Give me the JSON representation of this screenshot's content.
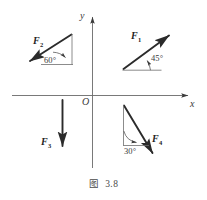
{
  "figure": {
    "caption_prefix": "图",
    "caption_number": "3.8",
    "background_color": "#ffffff",
    "ink_color": "#2e2e2e"
  },
  "axes": {
    "x_label": "x",
    "y_label": "y",
    "origin_label": "O",
    "x_axis_name": "horizontal-axis",
    "y_axis_name": "vertical-axis"
  },
  "forces": [
    {
      "id": "F1",
      "label_main": "F",
      "label_sub": "1",
      "angle_text": "45°",
      "quadrant": "first",
      "direction": "up-right",
      "description": "force vector pointing up and to the right at 45 degrees above the positive x direction"
    },
    {
      "id": "F2",
      "label_main": "F",
      "label_sub": "2",
      "angle_text": "60°",
      "quadrant": "second",
      "direction": "down-left",
      "description": "force vector pointing down and to the left, 60 degrees from horizontal reference"
    },
    {
      "id": "F3",
      "label_main": "F",
      "label_sub": "3",
      "angle_text": "",
      "quadrant": "third",
      "direction": "down",
      "description": "force vector pointing straight down, parallel to negative y direction"
    },
    {
      "id": "F4",
      "label_main": "F",
      "label_sub": "4",
      "angle_text": "30°",
      "quadrant": "fourth",
      "direction": "down-right",
      "description": "force vector pointing down and to the right, 30 degrees from vertical reference line"
    }
  ]
}
